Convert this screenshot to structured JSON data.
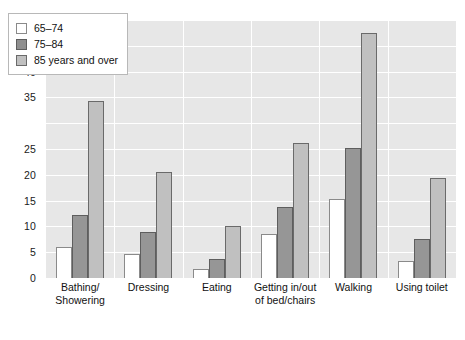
{
  "chart_data": {
    "type": "bar",
    "title": "",
    "subtitle": "",
    "xlabel": "",
    "ylabel": "",
    "ylim": [
      0,
      50
    ],
    "ytick_labels": [
      "0",
      "5",
      "10",
      "15",
      "20",
      "25",
      "35",
      "40",
      "45",
      "50"
    ],
    "ytick_values": [
      0,
      5,
      10,
      15,
      20,
      25,
      35,
      40,
      45,
      50
    ],
    "gridlines": "horizontal-and-vertical",
    "grid_color": "#ffffff",
    "plot_background": "#e7e7e7",
    "legend_position": "top-left-inside",
    "categories": [
      "Bathing/\nShowering",
      "Dressing",
      "Eating",
      "Getting in/out\nof bed/chairs",
      "Walking",
      "Using toilet"
    ],
    "series": [
      {
        "name": "65–74",
        "color": "#ffffff",
        "values": [
          6.0,
          4.6,
          1.8,
          8.5,
          15.3,
          3.3
        ]
      },
      {
        "name": "75–84",
        "color": "#969696",
        "values": [
          12.3,
          8.9,
          3.6,
          13.8,
          25.2,
          7.5
        ]
      },
      {
        "name": "85 years and over",
        "color": "#c0c0c0",
        "values": [
          34.3,
          20.6,
          10.1,
          26.2,
          47.5,
          19.3
        ]
      }
    ]
  }
}
